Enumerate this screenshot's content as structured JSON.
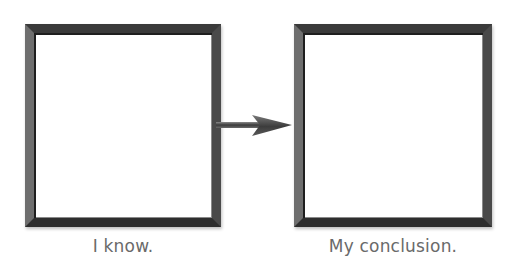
{
  "diagram": {
    "type": "flow",
    "nodes": [
      {
        "id": "known",
        "label": "I know.",
        "content": ""
      },
      {
        "id": "conclusion",
        "label": "My conclusion.",
        "content": ""
      }
    ],
    "edges": [
      {
        "from": "known",
        "to": "conclusion",
        "style": "arrow"
      }
    ]
  },
  "colors": {
    "border": "#4a4a4a",
    "arrow": "#555555",
    "label_text": "#6a6a6a",
    "background": "#ffffff"
  }
}
